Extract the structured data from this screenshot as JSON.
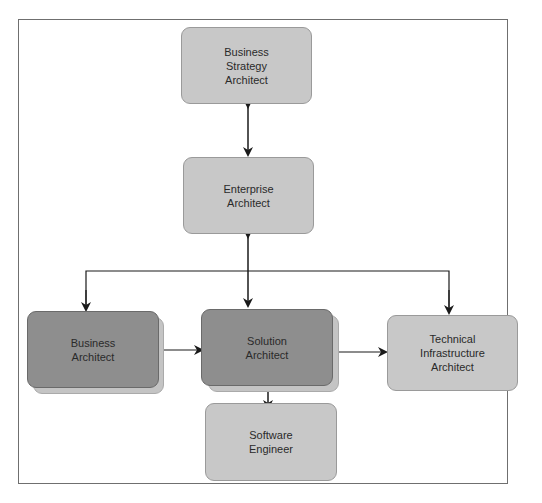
{
  "diagram": {
    "type": "architect-role-hierarchy",
    "nodes": [
      {
        "id": "business-strategy-architect",
        "label": "Business\nStrategy\nArchitect",
        "style": "light"
      },
      {
        "id": "enterprise-architect",
        "label": "Enterprise\nArchitect",
        "style": "light"
      },
      {
        "id": "business-architect",
        "label": "Business\nArchitect",
        "style": "dark"
      },
      {
        "id": "solution-architect",
        "label": "Solution\nArchitect",
        "style": "dark"
      },
      {
        "id": "technical-infrastructure-architect",
        "label": "Technical\nInfrastructure\nArchitect",
        "style": "light"
      },
      {
        "id": "software-engineer",
        "label": "Software\nEngineer",
        "style": "light"
      }
    ],
    "edges": [
      {
        "from": "business-strategy-architect",
        "to": "enterprise-architect",
        "direction": "both"
      },
      {
        "from": "enterprise-architect",
        "to": "solution-architect",
        "direction": "both"
      },
      {
        "from": "enterprise-architect",
        "to": "business-architect",
        "direction": "forward"
      },
      {
        "from": "enterprise-architect",
        "to": "technical-infrastructure-architect",
        "direction": "forward"
      },
      {
        "from": "business-architect",
        "to": "solution-architect",
        "direction": "both"
      },
      {
        "from": "solution-architect",
        "to": "technical-infrastructure-architect",
        "direction": "both"
      },
      {
        "from": "solution-architect",
        "to": "software-engineer",
        "direction": "both"
      }
    ],
    "colors": {
      "light_box": "#c8c8c8",
      "dark_box": "#8e8e8e",
      "arrow": "#1a1a1a",
      "frame": "#6f6f6f"
    }
  }
}
